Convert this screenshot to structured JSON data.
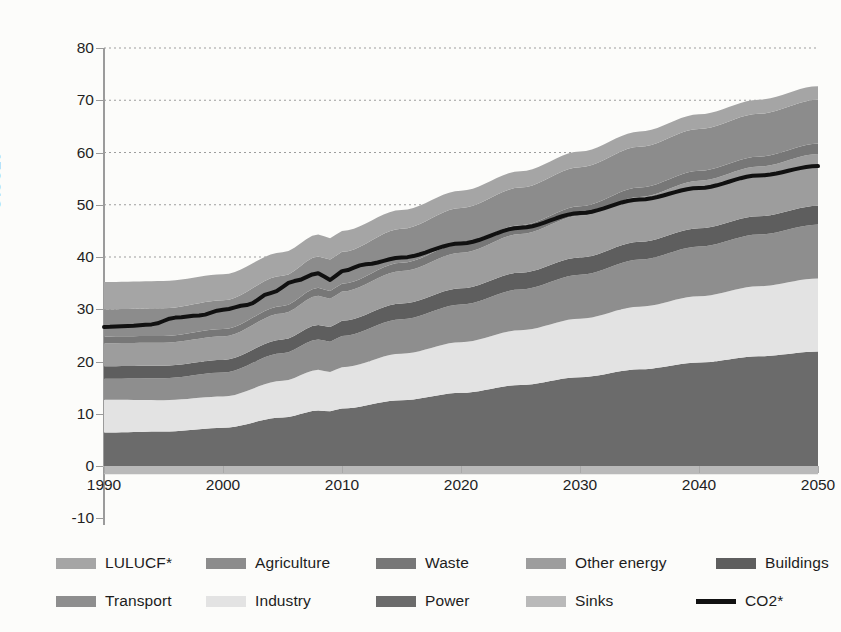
{
  "chart_data": {
    "type": "area",
    "title": "",
    "xlabel": "",
    "ylabel": "GtCO2e",
    "xlim": [
      1990,
      2050
    ],
    "ylim": [
      -10,
      80
    ],
    "yticks": [
      -10,
      0,
      10,
      20,
      30,
      40,
      50,
      60,
      70,
      80
    ],
    "xticks": [
      1990,
      2000,
      2010,
      2020,
      2030,
      2040,
      2050
    ],
    "grid": "horizontal-dotted",
    "legend_position": "bottom",
    "stack_order": [
      "Sinks",
      "Power",
      "Industry",
      "Transport",
      "Buildings",
      "Other energy",
      "Waste",
      "Agriculture",
      "LULUCF*"
    ],
    "x": [
      1990,
      1995,
      2000,
      2005,
      2008,
      2009,
      2010,
      2015,
      2020,
      2025,
      2030,
      2035,
      2040,
      2045,
      2050
    ],
    "series": [
      {
        "name": "Sinks",
        "color": "#b9b9b9",
        "values": [
          -1.6,
          -1.6,
          -1.6,
          -1.6,
          -1.6,
          -1.6,
          -1.6,
          -1.6,
          -1.6,
          -1.6,
          -1.6,
          -1.6,
          -1.6,
          -1.6,
          -1.6
        ]
      },
      {
        "name": "Power",
        "color": "#6b6b6b",
        "values": [
          6.4,
          6.6,
          7.3,
          9.3,
          10.6,
          10.5,
          11.0,
          12.6,
          14.0,
          15.5,
          17.0,
          18.5,
          19.8,
          21.0,
          21.9
        ]
      },
      {
        "name": "Industry",
        "color": "#e3e3e3",
        "values": [
          6.3,
          6.0,
          6.0,
          7.0,
          7.8,
          7.5,
          7.9,
          8.9,
          9.7,
          10.5,
          11.2,
          12.0,
          12.7,
          13.4,
          14.0
        ]
      },
      {
        "name": "Transport",
        "color": "#8e8e8e",
        "values": [
          4.0,
          4.2,
          4.6,
          5.3,
          5.8,
          5.8,
          6.0,
          6.6,
          7.2,
          7.8,
          8.4,
          9.0,
          9.5,
          9.9,
          10.3
        ]
      },
      {
        "name": "Buildings",
        "color": "#5e5e5e",
        "values": [
          2.4,
          2.4,
          2.4,
          2.6,
          2.8,
          2.8,
          2.9,
          3.0,
          3.1,
          3.2,
          3.3,
          3.4,
          3.5,
          3.5,
          3.6
        ]
      },
      {
        "name": "Other energy",
        "color": "#9d9d9d",
        "values": [
          4.4,
          4.4,
          4.5,
          5.0,
          5.6,
          5.4,
          5.6,
          6.2,
          6.8,
          7.4,
          8.0,
          8.6,
          9.1,
          9.5,
          9.9
        ]
      },
      {
        "name": "Waste",
        "color": "#777777",
        "values": [
          1.3,
          1.3,
          1.4,
          1.4,
          1.5,
          1.5,
          1.5,
          1.6,
          1.7,
          1.7,
          1.8,
          1.8,
          1.9,
          1.9,
          2.0
        ]
      },
      {
        "name": "Agriculture",
        "color": "#8c8c8c",
        "values": [
          5.2,
          5.3,
          5.5,
          5.8,
          6.0,
          6.0,
          6.1,
          6.5,
          6.9,
          7.2,
          7.5,
          7.8,
          8.0,
          8.2,
          8.4
        ]
      },
      {
        "name": "LULUCF*",
        "color": "#a5a5a5",
        "values": [
          5.2,
          5.2,
          5.0,
          4.5,
          4.2,
          4.1,
          4.0,
          3.6,
          3.3,
          3.1,
          3.0,
          2.9,
          2.8,
          2.7,
          2.6
        ]
      }
    ],
    "line_series": {
      "name": "CO2*",
      "color": "#111111",
      "x": [
        1990,
        1992,
        1994,
        1996,
        1998,
        2000,
        2002,
        2004,
        2006,
        2008,
        2009,
        2010,
        2012,
        2015,
        2020,
        2025,
        2030,
        2035,
        2040,
        2045,
        2050
      ],
      "values": [
        26.6,
        26.8,
        27.1,
        28.4,
        28.8,
        29.9,
        30.8,
        33.1,
        35.4,
        36.9,
        35.6,
        37.3,
        38.6,
        39.9,
        42.6,
        45.6,
        48.4,
        51.0,
        53.2,
        55.6,
        57.4
      ]
    }
  },
  "axis": {
    "y_title": "GtCO2e",
    "y_tick_labels": [
      "80",
      "70",
      "60",
      "50",
      "40",
      "30",
      "20",
      "10",
      "0",
      "-10"
    ],
    "x_tick_labels": [
      "1990",
      "2000",
      "2010",
      "2020",
      "2030",
      "2040",
      "2050"
    ]
  },
  "legend": {
    "row1": [
      {
        "label": "LULUCF*",
        "swatch": "#a5a5a5",
        "kind": "box"
      },
      {
        "label": "Agriculture",
        "swatch": "#8c8c8c",
        "kind": "box"
      },
      {
        "label": "Waste",
        "swatch": "#777777",
        "kind": "box"
      },
      {
        "label": "Other energy",
        "swatch": "#9d9d9d",
        "kind": "box"
      },
      {
        "label": "Buildings",
        "swatch": "#5e5e5e",
        "kind": "box"
      }
    ],
    "row2": [
      {
        "label": "Transport",
        "swatch": "#8e8e8e",
        "kind": "box"
      },
      {
        "label": "Industry",
        "swatch": "#e3e3e3",
        "kind": "box"
      },
      {
        "label": "Power",
        "swatch": "#6b6b6b",
        "kind": "box"
      },
      {
        "label": "Sinks",
        "swatch": "#b9b9b9",
        "kind": "box"
      },
      {
        "label": "CO2*",
        "swatch": "#111111",
        "kind": "line"
      }
    ]
  }
}
